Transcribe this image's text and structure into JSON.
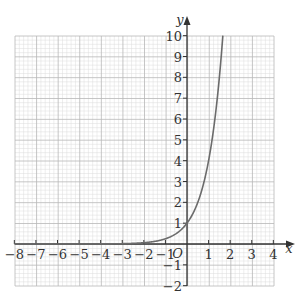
{
  "chart_data": {
    "type": "line",
    "title": "",
    "xlabel": "x",
    "ylabel": "y",
    "origin_label": "O",
    "xlim": [
      -8,
      4
    ],
    "ylim": [
      -2,
      10
    ],
    "x_ticks": [
      -8,
      -7,
      -6,
      -5,
      -4,
      -3,
      -2,
      -1,
      1,
      2,
      3,
      4
    ],
    "y_ticks": [
      -2,
      -1,
      1,
      2,
      3,
      4,
      5,
      6,
      7,
      8,
      9,
      10
    ],
    "x_tick_labels": [
      "−8",
      "−7",
      "−6",
      "−5",
      "−4",
      "−3",
      "−2",
      "−1",
      "1",
      "2",
      "3",
      "4"
    ],
    "y_tick_labels": [
      "−2",
      "−1",
      "1",
      "2",
      "3",
      "4",
      "5",
      "6",
      "7",
      "8",
      "9",
      "10"
    ],
    "grid": true,
    "grid_minor_subdivisions": 5,
    "series": [
      {
        "name": "y = 4^x",
        "function": "4^x",
        "x": [
          -8,
          -4,
          -3,
          -2,
          -1,
          -0.5,
          0,
          0.5,
          1,
          1.25,
          1.5,
          1.66
        ],
        "y": [
          1.53e-05,
          0.0039,
          0.0156,
          0.0625,
          0.25,
          0.5,
          1,
          2,
          4,
          5.66,
          8,
          10
        ]
      }
    ],
    "legend": null
  },
  "colors": {
    "curve": "#6b6b6b",
    "axis": "#333333",
    "grid_major": "#b8b8b8",
    "grid_minor": "#dcdcdc",
    "background": "#ffffff"
  }
}
